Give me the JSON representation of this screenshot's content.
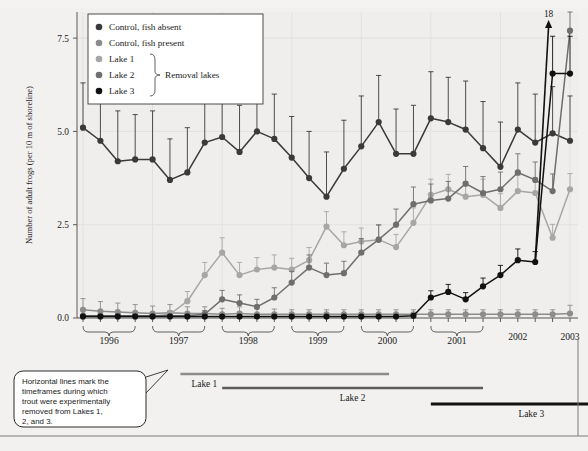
{
  "figure": {
    "background_color": "#f2f1ef",
    "plot_background_color": "#efeeec"
  },
  "axes": {
    "y_axis_label": "Number of adult frogs (per 10 m of shoreline)",
    "y_ticks": [
      "0.0",
      "2.5",
      "5.0",
      "7.5"
    ],
    "y_tick_values": [
      0.0,
      2.5,
      5.0,
      7.5
    ],
    "y_min": 0.0,
    "y_max": 8.2,
    "x_axis_label": "",
    "x_year_brackets": [
      "1996",
      "1997",
      "1998",
      "1999",
      "2000",
      "2001"
    ],
    "x_single_labels": [
      "2002",
      "2003"
    ]
  },
  "legend": {
    "entries": [
      {
        "label": "Control, fish absent",
        "color": "#3a3a3a"
      },
      {
        "label": "Control, fish present",
        "color": "#8c8c8c"
      },
      {
        "label": "Lake 1",
        "color": "#a6a6a6"
      },
      {
        "label": "Lake 2",
        "color": "#6e6e6e"
      },
      {
        "label": "Lake 3",
        "color": "#111111"
      }
    ],
    "group_label": "Removal lakes",
    "group_members": [
      "Lake 1",
      "Lake 2",
      "Lake 3"
    ]
  },
  "annotations": {
    "callout_text": "Horizontal lines mark the timeframes during which trout were experimentally removed from Lakes 1, 2, and 3.",
    "offscale_value": "18"
  },
  "removal_bars": [
    {
      "label": "Lake 1",
      "color": "#8c8c8c",
      "start_index": 5.6,
      "end_index": 17.6,
      "arrow": false
    },
    {
      "label": "Lake 2",
      "color": "#5c5c5c",
      "start_index": 8.0,
      "end_index": 23.0,
      "arrow": false
    },
    {
      "label": "Lake 3",
      "color": "#111111",
      "start_index": 20.0,
      "end_index": 30.4,
      "arrow": true
    }
  ],
  "chart_data": {
    "type": "line",
    "title": "",
    "xlabel": "",
    "ylabel": "Number of adult frogs (per 10 m of shoreline)",
    "ylim": [
      0.0,
      8.2
    ],
    "grid": true,
    "legend_position": "top-left",
    "x": [
      "1996-1",
      "1996-2",
      "1996-3",
      "1996-4",
      "1997-1",
      "1997-2",
      "1997-3",
      "1997-4",
      "1998-1",
      "1998-2",
      "1998-3",
      "1998-4",
      "1999-1",
      "1999-2",
      "1999-3",
      "1999-4",
      "2000-1",
      "2000-2",
      "2000-3",
      "2000-4",
      "2001-1",
      "2001-2",
      "2001-3",
      "2001-4",
      "2002-1",
      "2002-2",
      "2002-3",
      "2003-1",
      "2003-2"
    ],
    "series": [
      {
        "name": "Control, fish absent",
        "color": "#3a3a3a",
        "values": [
          5.1,
          4.75,
          4.2,
          4.25,
          4.25,
          3.7,
          3.9,
          4.7,
          4.85,
          4.45,
          5.0,
          4.8,
          4.3,
          3.75,
          3.25,
          4.0,
          4.6,
          5.25,
          4.4,
          4.4,
          5.35,
          5.25,
          5.05,
          4.55,
          4.05,
          5.05,
          4.7,
          4.95,
          4.75
        ],
        "errors": [
          1.2,
          1.25,
          1.35,
          1.2,
          1.3,
          1.1,
          1.2,
          1.25,
          1.35,
          1.25,
          1.3,
          1.2,
          1.1,
          1.25,
          1.2,
          1.3,
          1.35,
          1.25,
          1.2,
          1.3,
          1.25,
          1.2,
          1.3,
          1.25,
          1.2,
          1.25,
          1.3,
          1.25,
          1.2
        ]
      },
      {
        "name": "Control, fish present",
        "color": "#8c8c8c",
        "values": [
          0.22,
          0.18,
          0.16,
          0.14,
          0.12,
          0.14,
          0.12,
          0.12,
          0.1,
          0.12,
          0.1,
          0.1,
          0.1,
          0.1,
          0.1,
          0.1,
          0.1,
          0.1,
          0.1,
          0.1,
          0.1,
          0.1,
          0.1,
          0.1,
          0.1,
          0.1,
          0.1,
          0.1,
          0.12
        ],
        "errors": [
          0.3,
          0.26,
          0.24,
          0.22,
          0.2,
          0.22,
          0.18,
          0.18,
          0.16,
          0.18,
          0.14,
          0.14,
          0.12,
          0.12,
          0.12,
          0.12,
          0.12,
          0.12,
          0.12,
          0.12,
          0.12,
          0.12,
          0.12,
          0.12,
          0.12,
          0.12,
          0.12,
          0.12,
          0.22
        ]
      },
      {
        "name": "Lake 1",
        "color": "#a6a6a6",
        "values": [
          0.05,
          0.05,
          0.05,
          0.05,
          0.05,
          0.1,
          0.45,
          1.15,
          1.75,
          1.15,
          1.3,
          1.35,
          1.3,
          1.55,
          2.45,
          1.95,
          2.05,
          2.1,
          1.9,
          2.55,
          3.3,
          3.45,
          3.25,
          3.3,
          2.95,
          3.4,
          3.35,
          2.15,
          3.45
        ],
        "errors": [
          0.06,
          0.06,
          0.06,
          0.06,
          0.06,
          0.1,
          0.26,
          0.34,
          0.4,
          0.34,
          0.32,
          0.34,
          0.3,
          0.34,
          0.4,
          0.36,
          0.36,
          0.38,
          0.34,
          0.4,
          0.42,
          0.4,
          0.4,
          0.42,
          0.38,
          0.42,
          0.4,
          0.36,
          0.42
        ]
      },
      {
        "name": "Lake 2",
        "color": "#6e6e6e",
        "values": [
          0.06,
          0.06,
          0.06,
          0.06,
          0.06,
          0.06,
          0.06,
          0.1,
          0.5,
          0.4,
          0.3,
          0.55,
          0.95,
          1.35,
          1.15,
          1.2,
          1.75,
          2.1,
          2.5,
          3.05,
          3.15,
          3.2,
          3.6,
          3.35,
          3.45,
          3.9,
          3.7,
          3.4,
          7.7
        ],
        "errors": [
          0.06,
          0.06,
          0.06,
          0.06,
          0.06,
          0.06,
          0.06,
          0.1,
          0.24,
          0.22,
          0.2,
          0.26,
          0.3,
          0.34,
          0.32,
          0.32,
          0.38,
          0.4,
          0.42,
          0.46,
          0.44,
          0.46,
          0.46,
          0.44,
          0.46,
          0.5,
          0.48,
          0.46,
          0.55
        ]
      },
      {
        "name": "Lake 3",
        "color": "#111111",
        "values": [
          0.04,
          0.04,
          0.04,
          0.04,
          0.04,
          0.04,
          0.04,
          0.04,
          0.04,
          0.04,
          0.04,
          0.04,
          0.04,
          0.04,
          0.04,
          0.04,
          0.04,
          0.04,
          0.04,
          0.06,
          0.55,
          0.7,
          0.5,
          0.85,
          1.15,
          1.55,
          1.5,
          6.55,
          6.55
        ],
        "errors": [
          0.05,
          0.05,
          0.05,
          0.05,
          0.05,
          0.05,
          0.05,
          0.05,
          0.05,
          0.05,
          0.05,
          0.05,
          0.05,
          0.05,
          0.05,
          0.05,
          0.05,
          0.05,
          0.05,
          0.06,
          0.18,
          0.2,
          0.18,
          0.22,
          0.26,
          0.3,
          0.28,
          1.0,
          1.0
        ]
      }
    ],
    "offscale_annotation": {
      "series": "Lake 3",
      "label": "18",
      "at_index": 27
    }
  }
}
